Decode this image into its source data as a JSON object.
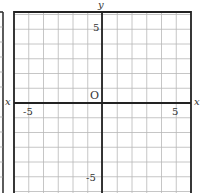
{
  "diagram": {
    "type": "coordinate-grid",
    "x_axis_label": "x",
    "y_axis_label": "y",
    "origin_label": "O",
    "x_range": [
      -6,
      6
    ],
    "y_range": [
      -6,
      6
    ],
    "grid_step": 1,
    "tick_labels": {
      "x_neg": "-5",
      "x_pos": "5",
      "y_pos": "5",
      "y_neg": "-5"
    },
    "colors": {
      "grid": "#b8b8b8",
      "axis": "#222222",
      "border": "#222222",
      "text": "#333333"
    }
  }
}
